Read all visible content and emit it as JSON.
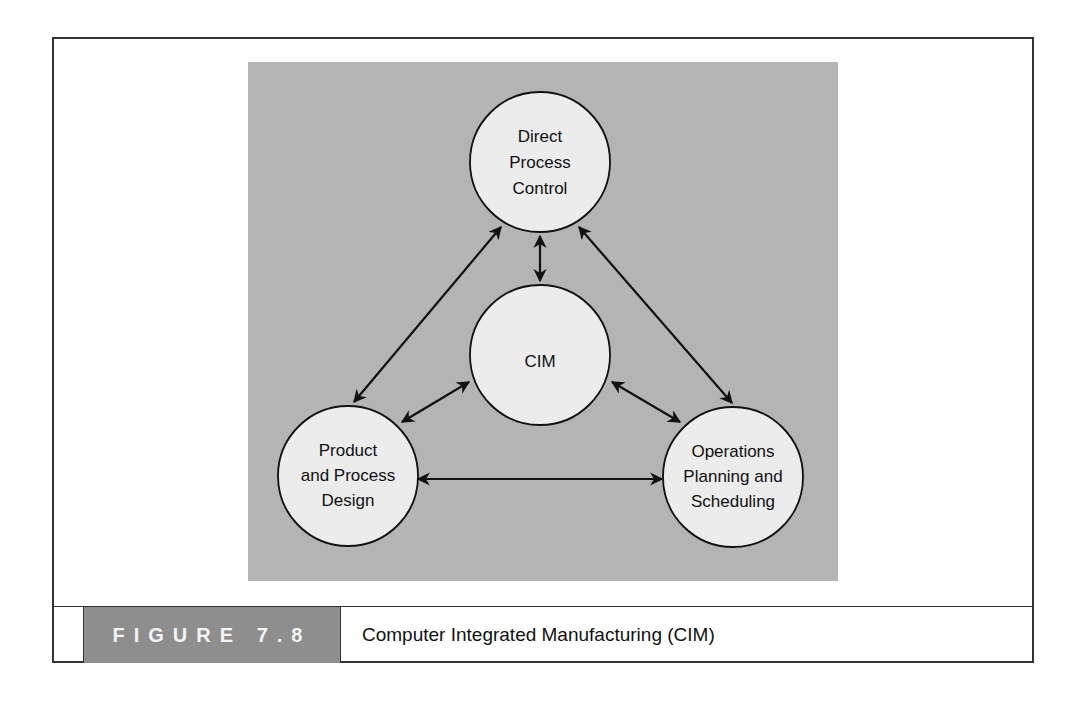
{
  "figure": {
    "label": "FIGURE 7.8",
    "title": "Computer Integrated Manufacturing (CIM)"
  },
  "diagram": {
    "nodes": [
      {
        "id": "dpc",
        "lines": [
          "Direct",
          "Process",
          "Control"
        ]
      },
      {
        "id": "cim",
        "lines": [
          "CIM"
        ]
      },
      {
        "id": "ppd",
        "lines": [
          "Product",
          "and Process",
          "Design"
        ]
      },
      {
        "id": "ops",
        "lines": [
          "Operations",
          "Planning and",
          "Scheduling"
        ]
      }
    ],
    "edges": [
      {
        "from": "dpc",
        "to": "cim",
        "type": "bidirectional"
      },
      {
        "from": "dpc",
        "to": "ppd",
        "type": "bidirectional"
      },
      {
        "from": "dpc",
        "to": "ops",
        "type": "bidirectional"
      },
      {
        "from": "cim",
        "to": "ppd",
        "type": "bidirectional"
      },
      {
        "from": "cim",
        "to": "ops",
        "type": "bidirectional"
      },
      {
        "from": "ppd",
        "to": "ops",
        "type": "bidirectional"
      }
    ]
  },
  "colors": {
    "panel_bg": "#b4b4b4",
    "node_fill": "#ececec",
    "label_bg": "#8e8e8e",
    "stroke": "#111111"
  }
}
